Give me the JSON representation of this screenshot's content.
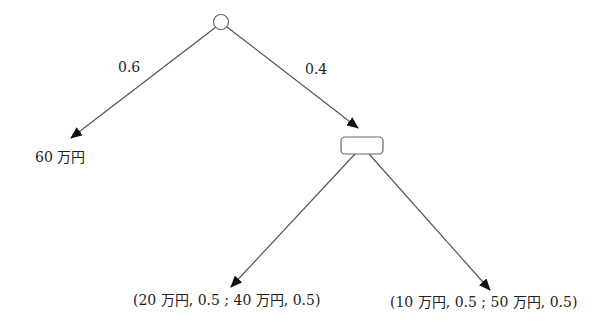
{
  "diagram": {
    "type": "decision-tree",
    "root": {
      "shape": "circle"
    },
    "branches": [
      {
        "probability": "0.6",
        "outcome": "60 万円"
      },
      {
        "probability": "0.4",
        "node": {
          "shape": "rounded-rectangle"
        },
        "children": [
          {
            "outcome": "(20 万円, 0.5 ; 40 万円, 0.5)"
          },
          {
            "outcome": "(10 万円, 0.5 ; 50 万円, 0.5)"
          }
        ]
      }
    ]
  },
  "colors": {
    "line": "#555555",
    "text": "#222222",
    "background": "#ffffff"
  }
}
